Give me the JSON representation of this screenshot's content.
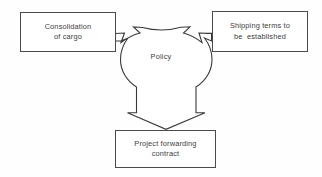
{
  "diagram": {
    "hub": {
      "label": "Policy",
      "shape": "three-pronged-arrow",
      "stroke_color": "#3a3a3a",
      "fill_color": "#ffffff"
    },
    "nodes": [
      {
        "id": "consolidation",
        "lines": [
          "Consolidation",
          "of cargo"
        ],
        "position": "top-left"
      },
      {
        "id": "shipping",
        "lines": [
          "Shipping terms to",
          "be  established"
        ],
        "position": "top-right"
      },
      {
        "id": "project",
        "lines": [
          "Project forwarding",
          "contract"
        ],
        "position": "bottom-center"
      }
    ],
    "arrows": [
      {
        "id": "arrow-to-consolidation",
        "from": "hub",
        "to": "consolidation",
        "direction": "up-left"
      },
      {
        "id": "arrow-to-shipping",
        "from": "hub",
        "to": "shipping",
        "direction": "up-right"
      },
      {
        "id": "arrow-to-project",
        "from": "hub",
        "to": "project",
        "direction": "down"
      }
    ],
    "colors": {
      "background": "#fefefe",
      "stroke": "#4a4a4a",
      "text": "#3d3d3d"
    }
  }
}
